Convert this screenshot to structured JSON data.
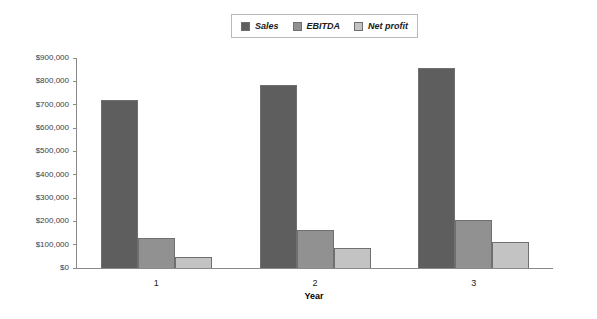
{
  "chart_data": {
    "type": "bar",
    "title": "",
    "subtitle": "",
    "xlabel": "Year",
    "ylabel": "",
    "categories": [
      "1",
      "2",
      "3"
    ],
    "series": [
      {
        "name": "Sales",
        "color": "#5e5e5e",
        "values": [
          720000,
          785000,
          858000
        ]
      },
      {
        "name": "EBITDA",
        "color": "#919191",
        "values": [
          130000,
          163000,
          206000
        ]
      },
      {
        "name": "Net profit",
        "color": "#c3c3c3",
        "values": [
          48000,
          86000,
          112000
        ]
      }
    ],
    "ylim": [
      0,
      900000
    ],
    "ytick_step": 100000,
    "ytick_labels": [
      "$900,000",
      "$800,000",
      "$700,000",
      "$600,000",
      "$500,000",
      "$400,000",
      "$300,000",
      "$200,000",
      "$100,000",
      "$0"
    ],
    "grid": false,
    "legend_position": "top-center",
    "bar_border_color": "#6f6f6f",
    "axis_color": "#8a8a8a",
    "background": "#ffffff"
  }
}
